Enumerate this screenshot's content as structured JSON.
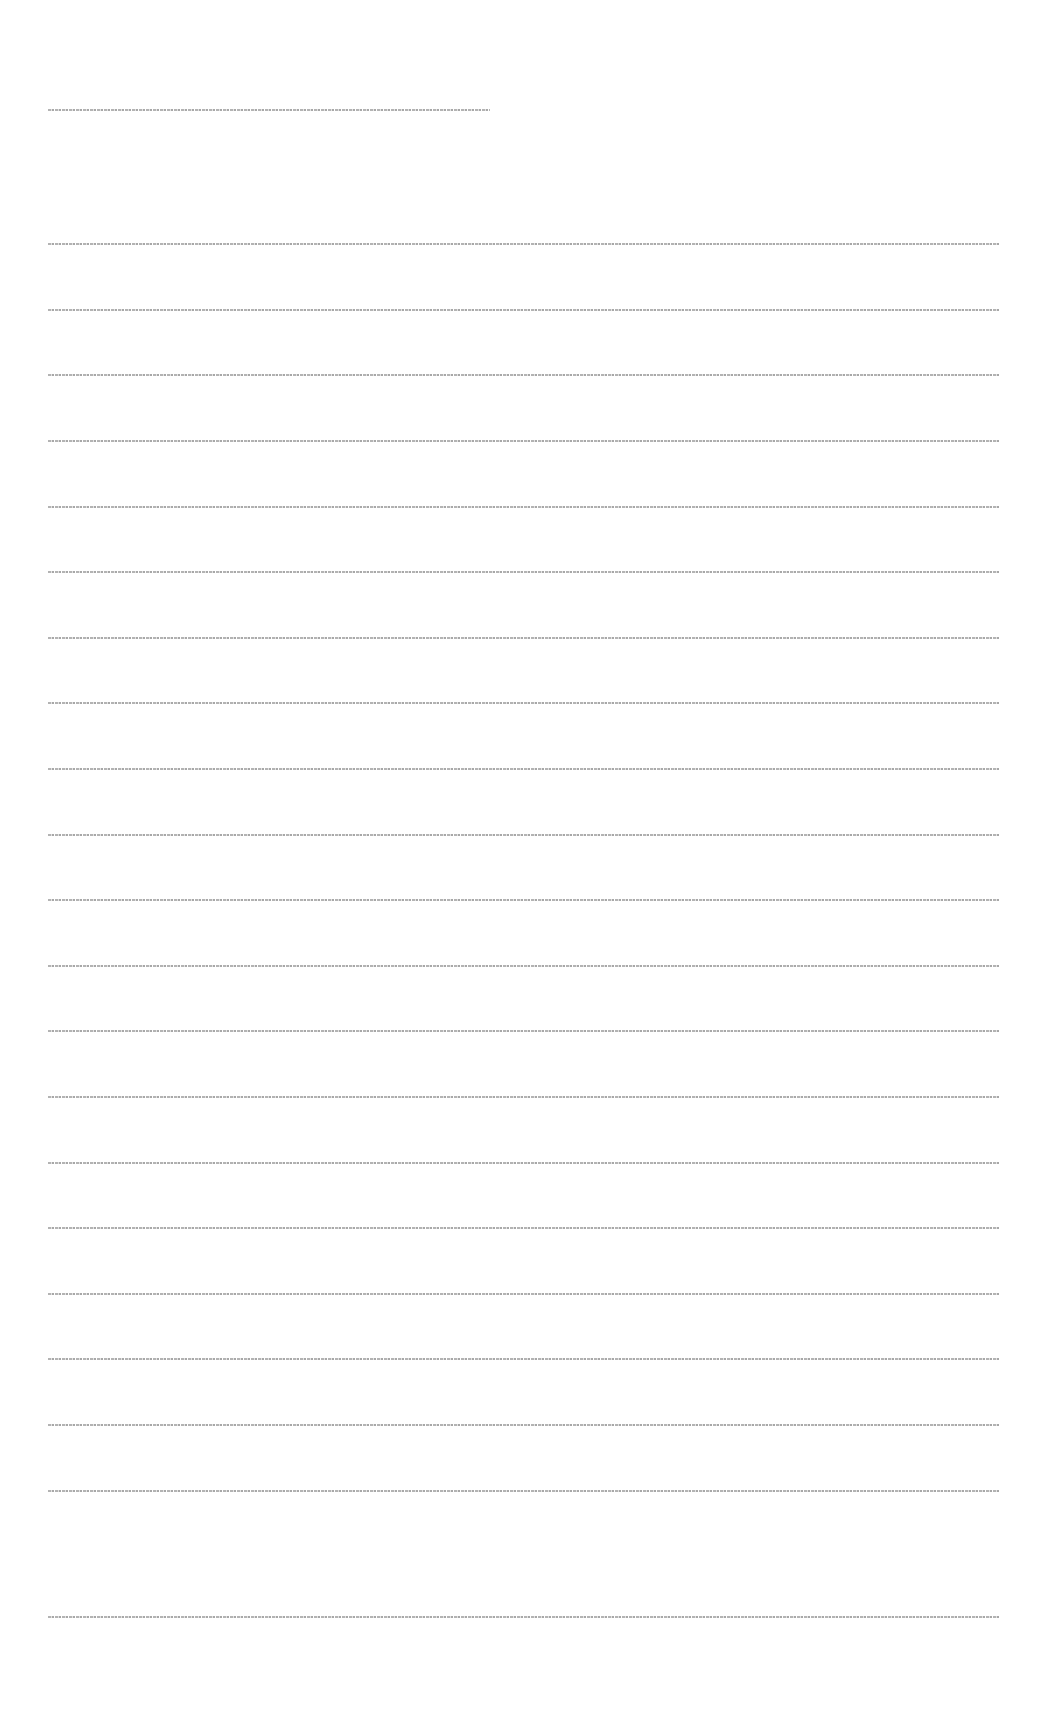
{
  "page": {
    "note": "Text is rendered at sub-pixel size and is not legible in the screenshot",
    "title_line": {
      "text": "",
      "top": 109
    },
    "lines": [
      {
        "text": "",
        "top": 243
      },
      {
        "text": "",
        "top": 309
      },
      {
        "text": "",
        "top": 374
      },
      {
        "text": "",
        "top": 440
      },
      {
        "text": "",
        "top": 506
      },
      {
        "text": "",
        "top": 571
      },
      {
        "text": "",
        "top": 637
      },
      {
        "text": "",
        "top": 702
      },
      {
        "text": "",
        "top": 768
      },
      {
        "text": "",
        "top": 834
      },
      {
        "text": "",
        "top": 899
      },
      {
        "text": "",
        "top": 965
      },
      {
        "text": "",
        "top": 1030
      },
      {
        "text": "",
        "top": 1096
      },
      {
        "text": "",
        "top": 1162
      },
      {
        "text": "",
        "top": 1227
      },
      {
        "text": "",
        "top": 1293
      },
      {
        "text": "",
        "top": 1358
      },
      {
        "text": "",
        "top": 1424
      },
      {
        "text": "",
        "top": 1490
      },
      {
        "text": "",
        "top": 1616
      }
    ]
  }
}
